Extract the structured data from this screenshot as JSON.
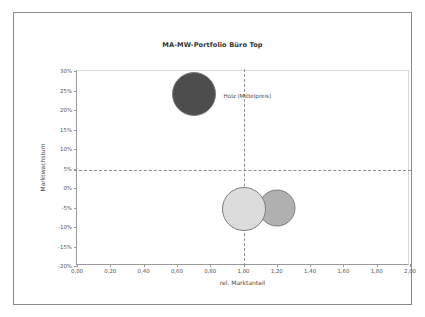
{
  "chart_data": {
    "type": "scatter",
    "title": "MA-MW-Portfolio Büro Top",
    "xlabel": "rel. Marktanteil",
    "ylabel": "Marktwachstum",
    "xlim": [
      0,
      2
    ],
    "ylim": [
      -20,
      30
    ],
    "grid": false,
    "legend": "none",
    "xticks": [
      "0,00",
      "0,20",
      "0,40",
      "0,60",
      "0,80",
      "1,00",
      "1,20",
      "1,40",
      "1,60",
      "1,80",
      "2,00"
    ],
    "xtick_values": [
      0,
      0.2,
      0.4,
      0.6,
      0.8,
      1.0,
      1.2,
      1.4,
      1.6,
      1.8,
      2.0
    ],
    "yticks": [
      "30%",
      "25%",
      "20%",
      "15%",
      "10%",
      "5%",
      "0%",
      "-5%",
      "-10%",
      "-15%",
      "-20%"
    ],
    "ytick_values": [
      30,
      25,
      20,
      15,
      10,
      5,
      0,
      -5,
      -10,
      -15,
      -20
    ],
    "reference_lines": [
      {
        "orientation": "vertical",
        "value": 1.0,
        "style": "dashed"
      },
      {
        "orientation": "horizontal",
        "value": 4.5,
        "style": "dashed"
      }
    ],
    "points": [
      {
        "label": "Holz (Mittelpreis)",
        "x": 0.7,
        "y": 24.0,
        "size": 44,
        "color": "#4d4d4d"
      },
      {
        "label": "",
        "x": 1.2,
        "y": -5.0,
        "size": 37,
        "color": "#b0b0b0"
      },
      {
        "label": "",
        "x": 1.0,
        "y": -5.5,
        "size": 44,
        "color": "#dcdcdc"
      }
    ],
    "annotations": [
      {
        "text": "Holz (Mittelpreis)",
        "x": 0.88,
        "y": 23.5
      }
    ]
  }
}
